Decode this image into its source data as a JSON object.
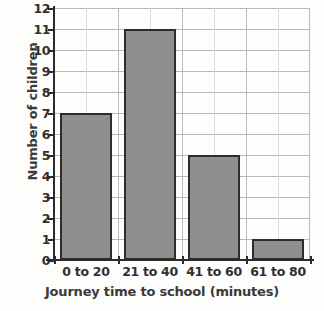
{
  "chart_data": {
    "type": "bar",
    "title": "",
    "xlabel": "Journey time to school (minutes)",
    "ylabel": "Number of children",
    "categories": [
      "0 to 20",
      "21 to 40",
      "41 to 60",
      "61 to 80"
    ],
    "values": [
      7,
      11,
      5,
      1
    ],
    "ylim": [
      0,
      12
    ],
    "ytick_labels": [
      "0",
      "1",
      "2",
      "3",
      "4",
      "5",
      "6",
      "7",
      "8",
      "9",
      "10",
      "11",
      "12"
    ],
    "ytick_values": [
      0,
      1,
      2,
      3,
      4,
      5,
      6,
      7,
      8,
      9,
      10,
      11,
      12
    ],
    "grid": true,
    "grid_minor": true,
    "legend": null,
    "bar_fill_color": "#8f8f8f",
    "bar_edge_color": "#2d2d2d",
    "grid_color": "#b9b9b9",
    "axis_color": "#2b2b2b",
    "background_color": "#fdfdfc"
  }
}
